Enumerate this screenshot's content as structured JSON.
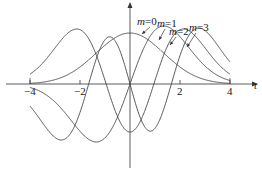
{
  "chart_data": {
    "type": "line",
    "title": "",
    "xlabel": "t",
    "ylabel": "",
    "xlim": [
      -4,
      4
    ],
    "x_ticks": [
      -4,
      -2,
      2,
      4
    ],
    "x_tick_labels": [
      "−4",
      "−2",
      "2",
      "4"
    ],
    "grid": false,
    "legend_position": "annotations with arrows, upper right",
    "series": [
      {
        "name": "m=0",
        "label_var": "m",
        "label_val": "=0",
        "parity": "even",
        "peak_t": 0,
        "description": "single positive hump centered at t=0"
      },
      {
        "name": "m=1",
        "label_var": "m",
        "label_val": "=1",
        "parity": "odd",
        "peak_t": 1.1,
        "trough_t": -1.1
      },
      {
        "name": "m=2",
        "label_var": "m",
        "label_val": "=2",
        "parity": "even",
        "peak_t": 1.6,
        "center_value": "negative"
      },
      {
        "name": "m=3",
        "label_var": "m",
        "label_val": "=3",
        "parity": "odd",
        "peak_t": 2.1,
        "trough_t": -2.1
      }
    ]
  }
}
